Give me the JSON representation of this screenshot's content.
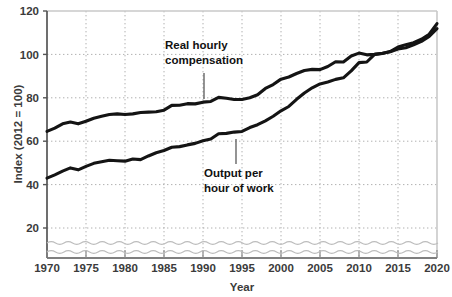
{
  "chart_data": {
    "type": "line",
    "title": "",
    "xlabel": "Year",
    "ylabel": "Index (2012 = 100)",
    "xlim": [
      1970,
      2020
    ],
    "ylim": [
      0,
      120
    ],
    "yticks": [
      20,
      40,
      60,
      80,
      100,
      120
    ],
    "xticks": [
      1970,
      1975,
      1980,
      1985,
      1990,
      1995,
      2000,
      2005,
      2010,
      2015,
      2020
    ],
    "grid": true,
    "legend_position": "inline-annotations",
    "axis_break": true,
    "axis_break_note": "wavy break on value axis below 20",
    "line_color": "#141414",
    "grid_color": "#b4b4b4",
    "x": [
      1970,
      1971,
      1972,
      1973,
      1974,
      1975,
      1976,
      1977,
      1978,
      1979,
      1980,
      1981,
      1982,
      1983,
      1984,
      1985,
      1986,
      1987,
      1988,
      1989,
      1990,
      1991,
      1992,
      1993,
      1994,
      1995,
      1996,
      1997,
      1998,
      1999,
      2000,
      2001,
      2002,
      2003,
      2004,
      2005,
      2006,
      2007,
      2008,
      2009,
      2010,
      2011,
      2012,
      2013,
      2014,
      2015,
      2016,
      2017,
      2018,
      2019,
      2020
    ],
    "series": [
      {
        "name": "Real hourly compensation",
        "annotation": "Real hourly\ncompensation",
        "values": [
          64.5,
          66.0,
          68.0,
          68.8,
          68.0,
          69.2,
          70.6,
          71.5,
          72.3,
          72.6,
          72.3,
          72.6,
          73.2,
          73.4,
          73.6,
          74.3,
          76.5,
          76.6,
          77.3,
          77.2,
          78.0,
          78.3,
          80.2,
          79.8,
          79.2,
          79.2,
          80.0,
          81.4,
          84.3,
          86.1,
          88.6,
          89.6,
          91.2,
          92.6,
          93.1,
          93.0,
          94.4,
          96.6,
          96.5,
          99.3,
          100.6,
          99.8,
          100.0,
          100.4,
          101.3,
          103.4,
          104.5,
          105.4,
          107.0,
          109.3,
          114.2
        ]
      },
      {
        "name": "Output per hour of work",
        "annotation": "Output per\nhour of work",
        "values": [
          43.0,
          44.5,
          46.2,
          47.7,
          46.8,
          48.4,
          49.8,
          50.5,
          51.2,
          51.0,
          50.8,
          51.8,
          51.5,
          53.2,
          54.7,
          55.7,
          57.2,
          57.5,
          58.3,
          59.0,
          60.2,
          61.0,
          63.4,
          63.6,
          64.2,
          64.5,
          66.3,
          67.6,
          69.4,
          71.5,
          74.0,
          76.0,
          79.3,
          82.2,
          84.6,
          86.4,
          87.3,
          88.5,
          89.2,
          92.4,
          96.2,
          96.5,
          100.0,
          100.5,
          101.2,
          102.5,
          103.1,
          104.4,
          106.0,
          108.3,
          111.9
        ]
      }
    ]
  },
  "labels": {
    "y_axis_title": "Index (2012 = 100)",
    "x_axis_title": "Year",
    "yticks": [
      "20",
      "40",
      "60",
      "80",
      "100",
      "120"
    ],
    "xticks": [
      "1970",
      "1975",
      "1980",
      "1985",
      "1990",
      "1995",
      "2000",
      "2005",
      "2010",
      "2015",
      "2020"
    ],
    "annotation_upper_line1": "Real hourly",
    "annotation_upper_line2": "compensation",
    "annotation_lower_line1": "Output per",
    "annotation_lower_line2": "hour of work"
  }
}
